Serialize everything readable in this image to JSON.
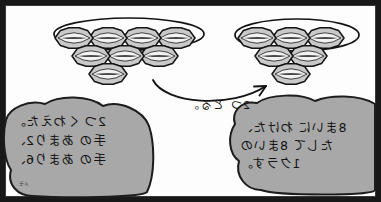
{
  "panel": {
    "title": "手のあまり — たしざん図",
    "border_color": "#181818",
    "paper_color": "#fdfdfd",
    "ink_color": "#141414",
    "bubble_fill": "#a8a8a8",
    "bubble_stroke": "#1c1c1c",
    "object_fill": "#c9c9c9",
    "object_stroke": "#141414",
    "mirrored": "true"
  },
  "groups": {
    "left": {
      "name": "左のかたまり",
      "rows": [
        3,
        2,
        1
      ],
      "total": 6,
      "has_loop": "true",
      "loop_row": 1
    },
    "right": {
      "name": "右のかたまり",
      "rows": [
        4,
        3,
        1
      ],
      "total": 8,
      "has_loop": "true",
      "loop_row": 1
    }
  },
  "arrow": {
    "name": "うつす やじるし",
    "label": "2つ とる。",
    "direction": "right-to-left"
  },
  "bubbles": {
    "left": {
      "lines": [
        "8まいに わけた、",
        "たして 8まいの",
        "1クラす。"
      ]
    },
    "right": {
      "lines": [
        "2つ くわえた。",
        "手の あまり2、",
        "手の あまり6、"
      ]
    }
  },
  "margin_mark": "メモ"
}
